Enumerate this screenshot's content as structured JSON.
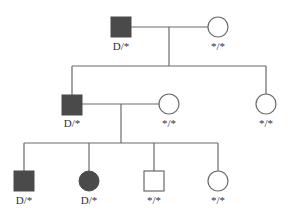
{
  "diagram": {
    "type": "pedigree",
    "colors": {
      "affected": "#4a4a4a",
      "unaffected": "#ffffff",
      "line": "#6a6a6a"
    },
    "generations": [
      {
        "individuals": [
          {
            "id": "I-1",
            "sex": "male",
            "affected": true,
            "genotype": "D/*"
          },
          {
            "id": "I-2",
            "sex": "female",
            "affected": false,
            "genotype": "*/*"
          }
        ]
      },
      {
        "individuals": [
          {
            "id": "II-1",
            "sex": "male",
            "affected": true,
            "genotype": "D/*"
          },
          {
            "id": "II-2",
            "sex": "female",
            "affected": false,
            "genotype": "*/*"
          },
          {
            "id": "II-3",
            "sex": "female",
            "affected": false,
            "genotype": "*/*"
          }
        ]
      },
      {
        "individuals": [
          {
            "id": "III-1",
            "sex": "male",
            "affected": true,
            "genotype": "D/*"
          },
          {
            "id": "III-2",
            "sex": "female",
            "affected": true,
            "genotype": "D/*"
          },
          {
            "id": "III-3",
            "sex": "male",
            "affected": false,
            "genotype": "*/*"
          },
          {
            "id": "III-4",
            "sex": "female",
            "affected": false,
            "genotype": "*/*"
          }
        ]
      }
    ]
  }
}
